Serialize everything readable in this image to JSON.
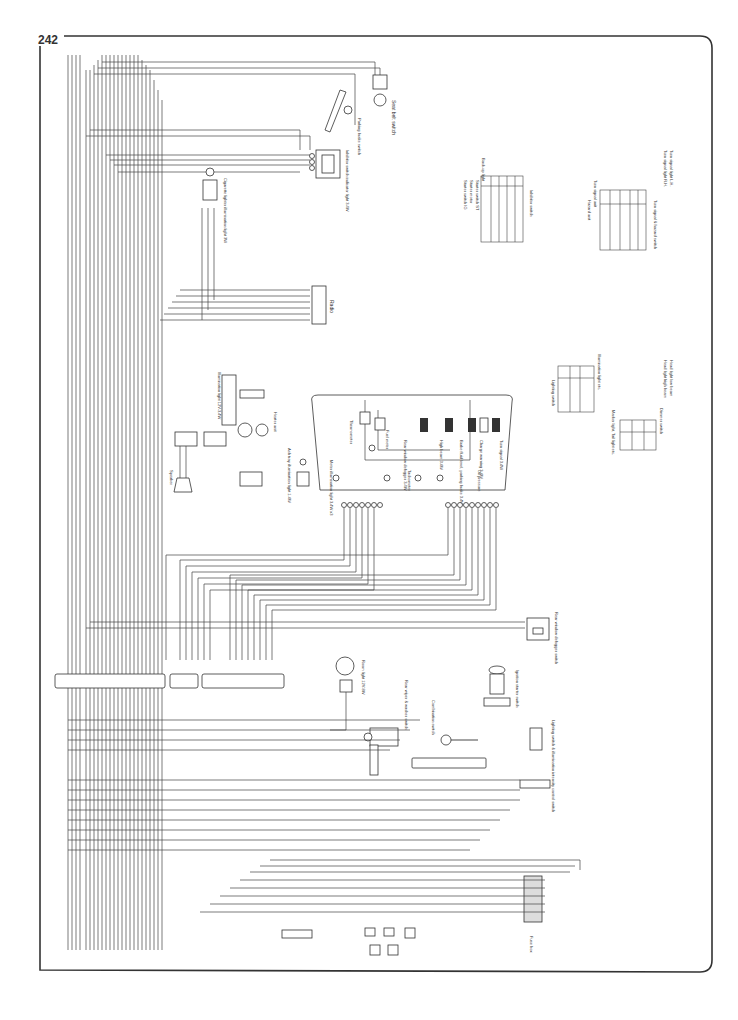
{
  "page": {
    "number": "242",
    "orientation": "rotated 90deg"
  },
  "components": {
    "seat_belt_switch": {
      "label": "Seat belt switch",
      "wires": [
        "0.5-BR",
        "0.5-B",
        "0.5-BG"
      ]
    },
    "parking_brake_switch": {
      "label": "Parking brake switch"
    },
    "inhibitor_indicator_light": {
      "label": "Inhibitor switch indicator light 3.4W",
      "wires": [
        "0.5-BR",
        "0.5-L",
        "0.5-LW",
        "0.5-RW",
        "0.5-L"
      ]
    },
    "cigarette_lighter": {
      "label": "Cigarette lighter illumination light 3W",
      "wires": [
        "0.5-R",
        "0.5-L",
        "0.5-B"
      ]
    },
    "radio": {
      "label": "Radio",
      "wires": [
        "0.5-WB",
        "0.5-W",
        "0.5-W",
        "0.5-B",
        "0.5-R",
        "0.5-L"
      ]
    },
    "illumination_light": {
      "label": "Illumination light 12V-3.4W"
    },
    "heater_unit": {
      "label": "Heater unit"
    },
    "speaker": {
      "label": "Speaker"
    },
    "ash_tray_light": {
      "label": "Ash tray illumination light 1.4W"
    },
    "meter": {
      "labels": [
        "Thermometer",
        "Fuel meter",
        "Rear window defogger 3.4W",
        "High beam 3.4W",
        "Brake fluid level, parking brake 3.4W",
        "Charge warning 3.4W",
        "Oil pressure",
        "Turn signal 3.4W",
        "Meter illumination light 3.4W x3",
        "Tachometer"
      ]
    },
    "inhibitor_switch": {
      "label": "Inhibitor switch",
      "annotations": [
        "Starter switch IG",
        "Starter motor",
        "Starter switch ST",
        "Back-up light"
      ],
      "headers": [
        "Terminal",
        "IG",
        "ST",
        "B",
        "L"
      ],
      "rows": [
        "Color",
        "P",
        "R",
        "N",
        "D",
        "2",
        "1"
      ]
    },
    "turn_signal_hazard_switch": {
      "label": "Turn signal & hazard switch",
      "annotations": [
        "Hazard unit",
        "Turn signal unit",
        "Turn signal light R.H.",
        "Turn signal light L.H."
      ],
      "rows": [
        "Terminal",
        "Color",
        "Turn signal",
        "Hazard"
      ]
    },
    "lighting_switch": {
      "label": "Lighting switch",
      "annotations": [
        "Illumination light etc.",
        "Marker light, Tail light etc."
      ],
      "rows": [
        "Terminal",
        "Color",
        "Off",
        "Tail",
        "Head"
      ]
    },
    "dimmer_switch": {
      "label": "Dimmer switch",
      "annotations": [
        "Head light high beam",
        "Head light low beam"
      ],
      "rows": [
        "Terminal",
        "Color",
        "Low",
        "High",
        "Pass"
      ]
    },
    "rear_window_defogger_switch": {
      "label": "Rear window defogger switch",
      "wires": [
        "0.5-LB",
        "0.5-LB"
      ]
    },
    "room_light": {
      "label": "Room light 12V-8W",
      "wires": [
        "0.5-BR",
        "0.5-BR"
      ]
    },
    "rear_wiper_washer_switch": {
      "label": "Rear wiper & washer switch",
      "wires": [
        "0.5-LY",
        "0.5-B",
        "0.5-L",
        "0.5-BL"
      ]
    },
    "combination_switch": {
      "label": "Combination switch"
    },
    "ignition_starter_switch": {
      "label": "Ignition starter switch",
      "wires": [
        "0.5-Y",
        "0.5-B",
        "0.5-R",
        "0.5-BR"
      ]
    },
    "lighting_switch_control": {
      "label": "Lighting switch & illumination intensity control switch"
    },
    "fuse_box": {
      "label": "Fuse box",
      "wires": [
        "0.85-LW",
        "0.5-LW",
        "0.85-L",
        "0.5-L",
        "0.5-R",
        "0.5-B"
      ]
    }
  },
  "connector_strip": {
    "wires_left": [
      "0.5-BY",
      "0.5-BY",
      "0.5-BW",
      "0.5-W",
      "0.5-BR",
      "0.5-LG",
      "0.5-GR",
      "0.5-GL",
      "0.5-L",
      "0.5-LW",
      "0.5-LW",
      "0.5-Y",
      "0.5-YR",
      "0.5-G",
      "0.5-YL",
      "0.5-GW",
      "0.5-GR",
      "0.5-BP",
      "0.5-BR",
      "0.5-BG"
    ],
    "wires_right": [
      "0.5-LY",
      "0.5-B",
      "0.5-BY",
      "0.5-Y",
      "0.5-LR",
      "0.5-WR",
      "0.5-BL",
      "0.5-R",
      "0.5-LW",
      "0.5-G",
      "0.5-B",
      "0.5-YL"
    ]
  },
  "border": {
    "color": "#333333"
  }
}
